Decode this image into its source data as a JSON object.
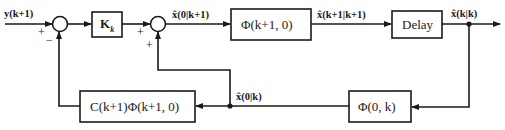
{
  "diagram": {
    "type": "block-diagram",
    "input_label": "y(k+1)",
    "sum1": {
      "plus": "+",
      "minus": "−"
    },
    "sum2": {
      "plus_left": "+",
      "plus_bottom": "+"
    },
    "blocks": {
      "gain": "K",
      "gain_sub": "k",
      "transition": "Φ(k+1, 0)",
      "delay": "Delay",
      "backward": "Φ(0, k)",
      "measurement": "C(k+1)Φ(k+1, 0)"
    },
    "signals": {
      "x0_k1": "x̂(0|k+1)",
      "xk1_k1": "x̂(k+1|k+1)",
      "xk_k": "x̂(k|k)",
      "x0_k": "x̂(0|k)"
    },
    "colors": {
      "line": "#1a1a1a",
      "background": "#ffffff"
    }
  }
}
